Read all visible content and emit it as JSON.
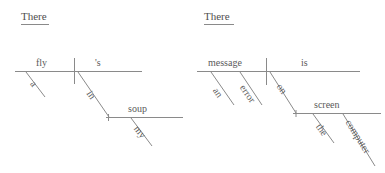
{
  "page": {
    "background_color": "#ffffff",
    "line_color": "#8a8a8a",
    "text_color": "#5a5a5a",
    "width": 385,
    "height": 173
  },
  "diagrams": [
    {
      "id": "left-diagram",
      "header": "There",
      "sentence": "There's a fly in my soup",
      "nodes": {
        "subject": "fly",
        "predicate": "'s",
        "subject_modifier": "a",
        "preposition": "in",
        "object_of_preposition": "soup",
        "object_modifier": "my"
      }
    },
    {
      "id": "right-diagram",
      "header": "There",
      "sentence": "There is an error message on the computer screen",
      "nodes": {
        "subject": "message",
        "predicate": "is",
        "subject_modifier_1": "an",
        "subject_modifier_2": "error",
        "preposition": "on",
        "object_of_preposition": "screen",
        "object_modifier_1": "the",
        "object_modifier_2": "computer"
      }
    }
  ]
}
